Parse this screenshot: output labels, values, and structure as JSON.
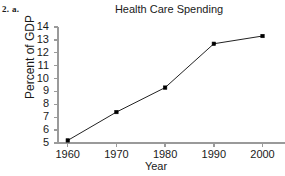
{
  "figure": {
    "exercise_label": "2. a."
  },
  "chart_data": {
    "type": "line",
    "title": "Health Care Spending",
    "xlabel": "Year",
    "ylabel": "Percent of GDP",
    "x": [
      1960,
      1970,
      1980,
      1990,
      2000
    ],
    "values": [
      5.2,
      7.4,
      9.3,
      12.7,
      13.3
    ],
    "categories": [
      "1960",
      "1970",
      "1980",
      "1990",
      "2000"
    ],
    "xticklabels": [
      "1960",
      "1970",
      "1980",
      "1990",
      "2000"
    ],
    "yticklabels": [
      "14",
      "13",
      "12",
      "11",
      "10",
      "9",
      "8",
      "7",
      "6",
      "5"
    ],
    "yticks": [
      14,
      13,
      12,
      11,
      10,
      9,
      8,
      7,
      6,
      5
    ],
    "ylim": [
      5,
      14
    ],
    "xlim": [
      1958,
      2004
    ],
    "grid": false,
    "legend": false,
    "marker": "square",
    "line_color": "#222222",
    "marker_color": "#000000",
    "axis_color": "#9a9a9a"
  }
}
